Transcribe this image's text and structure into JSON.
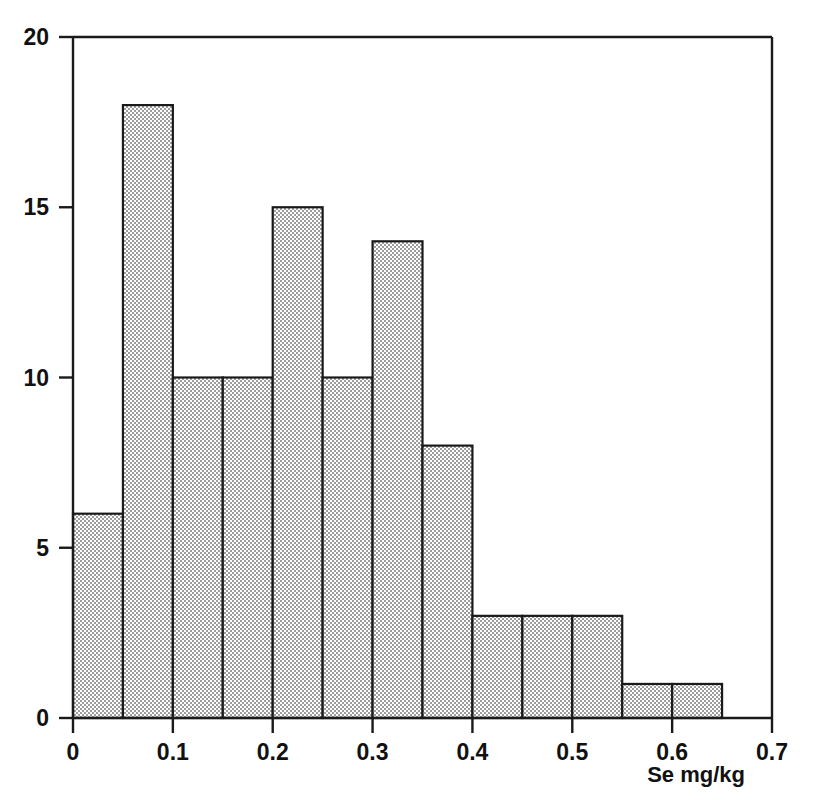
{
  "figure": {
    "background_color": "#ffffff",
    "axis_color": "#1a1a1a",
    "bar_edge_color": "#1a1a1a",
    "bar_fill_color": "#9a9a9a",
    "bar_fill_pattern": "fine-checker-dither"
  },
  "chart_data": {
    "type": "bar",
    "chart_subtype": "histogram",
    "title": "",
    "subtitle": "",
    "xlabel": "Se mg/kg",
    "ylabel": "",
    "xlim": [
      0,
      0.7
    ],
    "ylim": [
      0,
      20
    ],
    "grid": false,
    "legend": null,
    "bin_width": 0.05,
    "bin_edges": [
      0,
      0.05,
      0.1,
      0.15,
      0.2,
      0.25,
      0.3,
      0.35,
      0.4,
      0.45,
      0.5,
      0.55,
      0.6,
      0.65
    ],
    "categories": [
      "0.00-0.05",
      "0.05-0.10",
      "0.10-0.15",
      "0.15-0.20",
      "0.20-0.25",
      "0.25-0.30",
      "0.30-0.35",
      "0.35-0.40",
      "0.40-0.45",
      "0.45-0.50",
      "0.50-0.55",
      "0.55-0.60",
      "0.60-0.65"
    ],
    "values": [
      6,
      18,
      10,
      10,
      15,
      10,
      14,
      8,
      3,
      3,
      3,
      1,
      1
    ],
    "total_count": 102,
    "xticks": [
      0,
      0.1,
      0.2,
      0.3,
      0.4,
      0.5,
      0.6,
      0.7
    ],
    "xtick_labels": [
      "0",
      "0.1",
      "0.2",
      "0.3",
      "0.4",
      "0.5",
      "0.6",
      "0.7"
    ],
    "yticks": [
      0,
      5,
      10,
      15,
      20
    ],
    "ytick_labels": [
      "0",
      "5",
      "10",
      "15",
      "20"
    ]
  }
}
